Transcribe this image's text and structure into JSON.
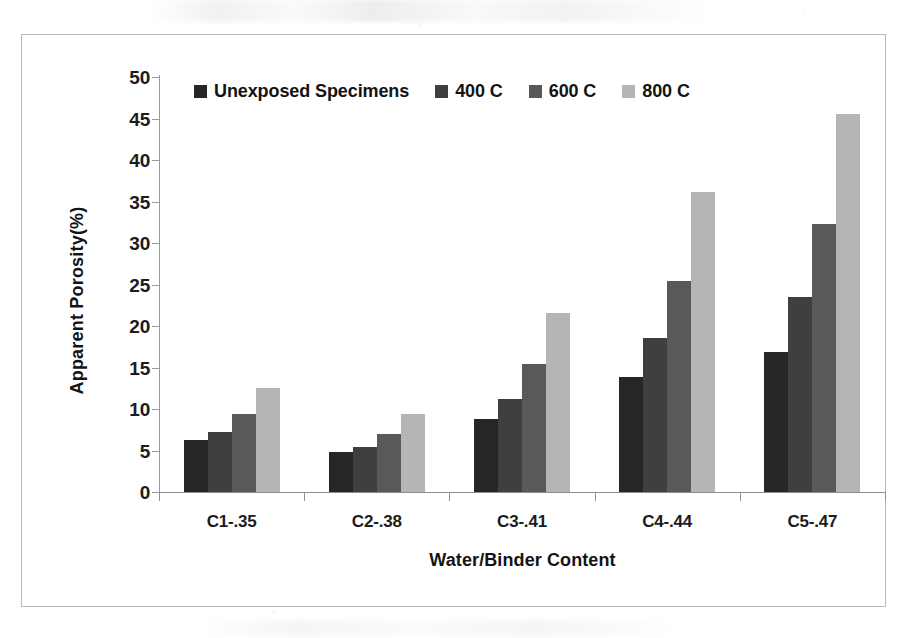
{
  "chart_data": {
    "type": "bar",
    "title": "",
    "xlabel": "Water/Binder Content",
    "ylabel": "Apparent Porosity(%)",
    "categories": [
      "C1-.35",
      "C2-.38",
      "C3-.41",
      "C4-.44",
      "C5-.47"
    ],
    "series": [
      {
        "name": "Unexposed Specimens",
        "color": "#262626",
        "values": [
          6.3,
          4.8,
          8.8,
          13.8,
          16.9
        ]
      },
      {
        "name": "400 C",
        "color": "#3f3f3f",
        "values": [
          7.2,
          5.4,
          11.2,
          18.5,
          23.5
        ]
      },
      {
        "name": "600 C",
        "color": "#595959",
        "values": [
          9.4,
          7.0,
          15.4,
          25.4,
          32.3
        ]
      },
      {
        "name": "800 C",
        "color": "#b5b5b5",
        "values": [
          12.5,
          9.4,
          21.6,
          36.1,
          45.6
        ]
      }
    ],
    "ylim": [
      0,
      50
    ],
    "ytick_step": 5,
    "yticks": [
      "0",
      "5",
      "10",
      "15",
      "20",
      "25",
      "30",
      "35",
      "40",
      "45",
      "50"
    ],
    "grid": false,
    "legend_position": "top-left-inside",
    "frame": true,
    "background_color": "#ffffff",
    "axis_color": "#8f8f8f",
    "text_color": "#1c1c1c"
  }
}
